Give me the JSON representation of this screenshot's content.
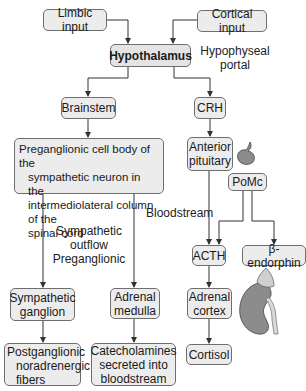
{
  "diagram": {
    "nodes": {
      "limbic_input": "Limbic input",
      "cortical_input": "Cortical input",
      "hypothalamus": "Hypothalamus",
      "brainstem": "Brainstem",
      "crh": "CRH",
      "preganglionic": [
        "Preganglionic cell body of the",
        "sympathetic neuron in the",
        "intermediolateral column of the",
        "spinal cord"
      ],
      "anterior_pituitary": [
        "Anterior",
        "pituitary"
      ],
      "pomc": "PoMc",
      "acth": "ACTH",
      "beta_endorphin": "β-endorphin",
      "sympathetic_ganglion": [
        "Sympathetic",
        "ganglion"
      ],
      "adrenal_medulla": [
        "Adrenal",
        "medulla"
      ],
      "adrenal_cortex": [
        "Adrenal",
        "cortex"
      ],
      "postganglionic": [
        "Postganglionic",
        "noradrenergic",
        "fibers"
      ],
      "catecholamines": [
        "Catecholamines",
        "secreted into",
        "bloodstream"
      ],
      "cortisol": "Cortisol"
    },
    "labels": {
      "hypophyseal_portal": [
        "Hypophyseal",
        "portal"
      ],
      "bloodstream": "Bloodstream",
      "sympathetic_outflow": [
        "Sympathetic",
        "outflow",
        "Preganglionic"
      ]
    },
    "illustrations": {
      "pituitary": "pituitary-gland-icon",
      "kidney": "kidney-adrenal-icon"
    },
    "colors": {
      "box_fill": "#ececec",
      "box_border": "#6e6e6e",
      "line": "#333333",
      "organ_fill": "#8c8c8c"
    }
  }
}
